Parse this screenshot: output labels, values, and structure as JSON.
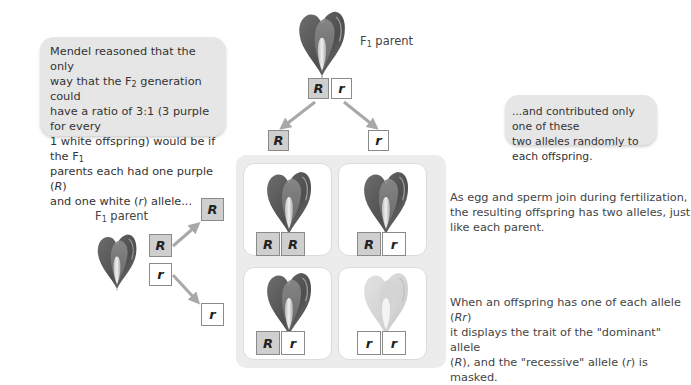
{
  "left_bubble": {
    "line1": "Mendel reasoned that the only",
    "line2_pre": "way that the F",
    "line2_sub": "2",
    "line2_post": " generation could",
    "line3": "have a ratio of 3:1 (3 purple for every",
    "line4_pre": "1 white offspring) would be if the F",
    "line4_sub": "1",
    "line5_pre": "parents each had one purple (",
    "line5_allele": "R",
    "line5_post": ")",
    "line6_pre": "and one white (",
    "line6_allele": "r",
    "line6_post": ") allele..."
  },
  "right_bubble": {
    "line1": "...and contributed only one of these",
    "line2": "two alleles randomly to each offspring."
  },
  "top_parent": {
    "label_pre": "F",
    "label_sub": "1",
    "label_post": " parent",
    "alleles": [
      "R",
      "r"
    ],
    "gametes": [
      "R",
      "r"
    ]
  },
  "left_parent": {
    "label_pre": "F",
    "label_sub": "1",
    "label_post": " parent",
    "alleles": [
      "R",
      "r"
    ],
    "gametes": [
      "R",
      "r"
    ]
  },
  "offspring": [
    {
      "alleles": [
        "R",
        "R"
      ],
      "phenotype": "purple"
    },
    {
      "alleles": [
        "R",
        "r"
      ],
      "phenotype": "purple"
    },
    {
      "alleles": [
        "R",
        "r"
      ],
      "phenotype": "purple"
    },
    {
      "alleles": [
        "r",
        "r"
      ],
      "phenotype": "white"
    }
  ],
  "note_fertilization": {
    "line1": "As egg and sperm join during fertilization,",
    "line2": "the resulting offspring has two alleles, just",
    "line3": "like each parent."
  },
  "note_dominance": {
    "line1_pre": "When an offspring has one of each allele (",
    "line1_allele": "Rr",
    "line1_post": ")",
    "line2": "it displays the trait of the \"dominant\" allele",
    "line3_pre": "(",
    "line3_allele1": "R",
    "line3_mid": "), and the \"recessive\" allele (",
    "line3_allele2": "r",
    "line3_post": ") is masked."
  },
  "colors": {
    "dominant_box": "#cfcfcf",
    "recessive_box": "#ffffff",
    "panel": "#ececec",
    "bubble": "#e6e6e6",
    "arrow": "#a8a8a8",
    "purple_flower_dark": "#5a5a5a",
    "white_flower": "#d8d8d8"
  }
}
